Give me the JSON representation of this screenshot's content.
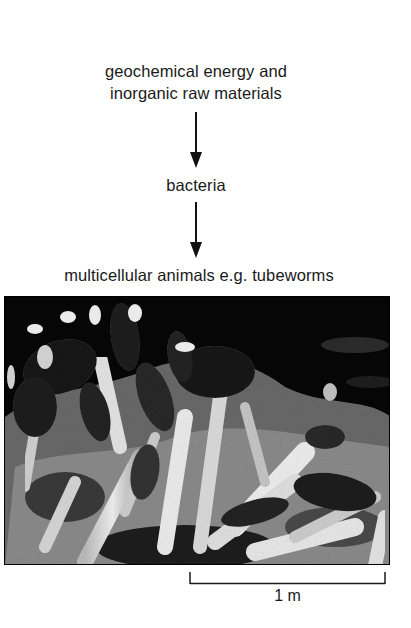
{
  "diagram": {
    "type": "food-chain-flow",
    "nodes": [
      {
        "id": "energy",
        "line1": "geochemical energy and",
        "line2": "inorganic raw materials"
      },
      {
        "id": "bacteria",
        "label": "bacteria"
      },
      {
        "id": "animals",
        "label": "multicellular animals e.g. tubeworms"
      }
    ],
    "edges": [
      {
        "from": "energy",
        "to": "bacteria",
        "icon": "arrow-down-icon"
      },
      {
        "from": "bacteria",
        "to": "animals",
        "icon": "arrow-down-icon"
      }
    ]
  },
  "photo": {
    "subject": "tubeworms photograph (black and white)",
    "scale_bar": {
      "label": "1 m"
    }
  },
  "colors": {
    "text": "#1a1a1a",
    "arrow": "#111111",
    "background": "#ffffff",
    "photo_dark": "#050505",
    "photo_light": "#e8e8e8"
  }
}
